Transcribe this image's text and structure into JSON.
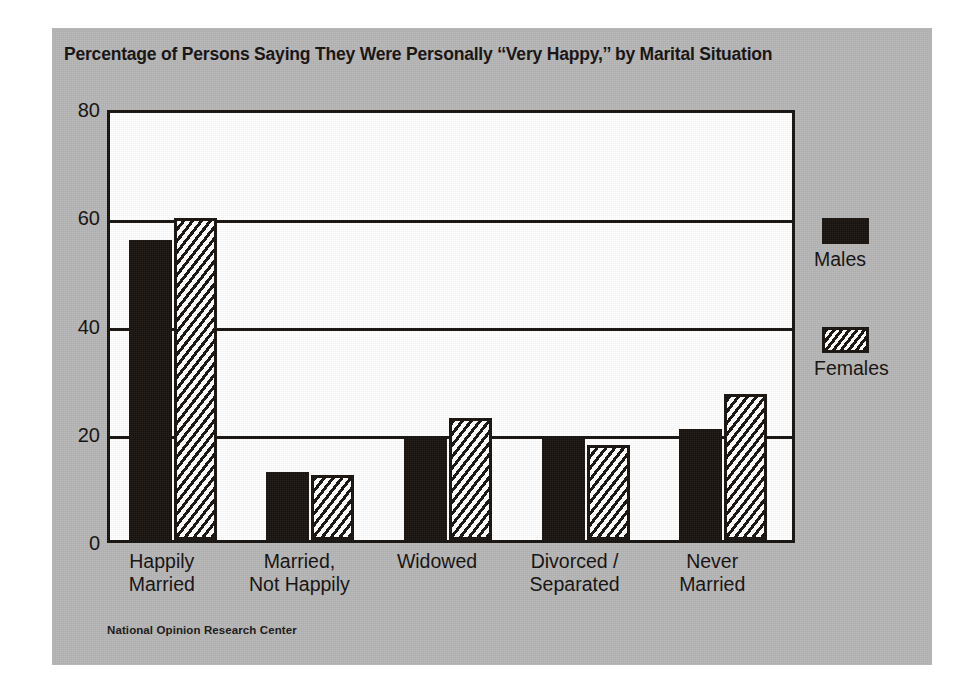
{
  "figure": {
    "title": "Percentage of Persons Saying They Were Personally ‘‘Very Happy,’’ by Marital Situation",
    "source": "National Opinion Research Center",
    "panel_color": "#b6b6b6",
    "ink_color": "#16120f",
    "plot_background": "#ffffff"
  },
  "legend": {
    "position": "right",
    "entries": [
      {
        "label": "Males",
        "swatch": "solid-black-swatch"
      },
      {
        "label": "Females",
        "swatch": "hatched-swatch"
      }
    ]
  },
  "chart_data": {
    "type": "bar",
    "title": "Percentage of Persons Saying They Were Personally ‘‘Very Happy,’’ by Marital Situation",
    "xlabel": "",
    "ylabel": "",
    "ylim": [
      0,
      80
    ],
    "yticks": [
      0,
      20,
      40,
      60,
      80
    ],
    "ytick_labels": [
      "0",
      "20",
      "40",
      "60",
      "80"
    ],
    "grid": true,
    "categories": [
      "Happily Married",
      "Married, Not Happily",
      "Widowed",
      "Divorced / Separated",
      "Never Married"
    ],
    "category_lines": [
      [
        "Happily",
        "Married"
      ],
      [
        "Married,",
        "Not Happily"
      ],
      [
        "Widowed",
        ""
      ],
      [
        "Divorced /",
        "Separated"
      ],
      [
        "Never",
        "Married"
      ]
    ],
    "series": [
      {
        "name": "Males",
        "values": [
          55.5,
          12.5,
          19.0,
          19.0,
          20.5
        ]
      },
      {
        "name": "Females",
        "values": [
          59.5,
          12.0,
          22.5,
          17.5,
          27.0
        ]
      }
    ]
  }
}
